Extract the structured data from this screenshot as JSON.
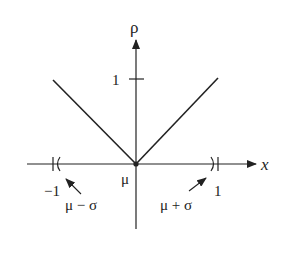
{
  "diagram": {
    "y_axis_label": "ρ",
    "x_axis_label": "x",
    "y_tick_label": "1",
    "origin_label": "μ",
    "left_tick_label": "−1",
    "right_tick_label": "1",
    "left_annotation": "μ − σ",
    "right_annotation": "μ + σ",
    "line_color": "#222222",
    "background": "#ffffff"
  }
}
